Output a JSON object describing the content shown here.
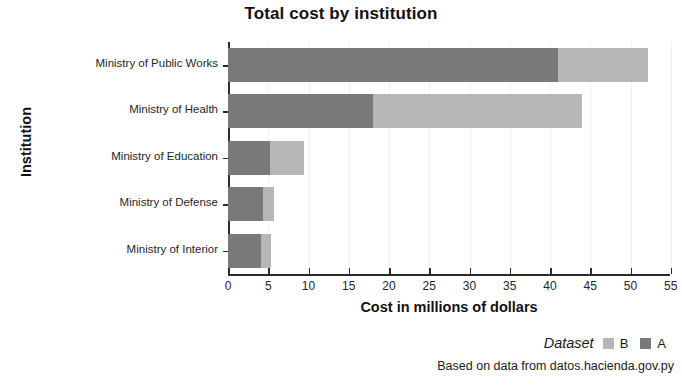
{
  "chart_data": {
    "type": "bar",
    "orientation": "horizontal",
    "stacked": true,
    "title": "Total cost by institution",
    "xlabel": "Cost in millions of dollars",
    "ylabel": "Institution",
    "categories": [
      "Ministry of Public Works",
      "Ministry of Health",
      "Ministry of Education",
      "Ministry of Defense",
      "Ministry of Interior"
    ],
    "series": [
      {
        "name": "A",
        "color": "#797979",
        "values": [
          41,
          18,
          5.2,
          4.3,
          4.1
        ]
      },
      {
        "name": "B",
        "color": "#b6b6b6",
        "values": [
          11.2,
          26,
          4.2,
          1.4,
          1.2
        ]
      }
    ],
    "totals": [
      52.2,
      44,
      9.4,
      5.7,
      5.3
    ],
    "xlim": [
      0,
      55
    ],
    "xticks": [
      0,
      5,
      10,
      15,
      20,
      25,
      30,
      35,
      40,
      45,
      50,
      55
    ],
    "xtick_labels": [
      "0",
      "5",
      "10",
      "15",
      "20",
      "25",
      "30",
      "35",
      "40",
      "45",
      "50",
      "55"
    ],
    "grid": false,
    "legend_position": "bottom-right",
    "legend_title": "Dataset",
    "legend_order": [
      "B",
      "A"
    ],
    "caption": "Based on data from datos.hacienda.gov.py"
  },
  "legend": {
    "title": "Dataset",
    "entries": [
      {
        "label": "B",
        "color": "#b6b6b6"
      },
      {
        "label": "A",
        "color": "#797979"
      }
    ]
  },
  "caption": {
    "text": "Based on data from datos.hacienda.gov.py"
  }
}
